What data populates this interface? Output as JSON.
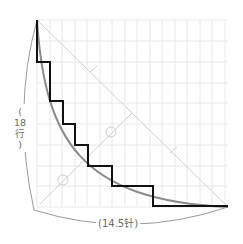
{
  "diagram": {
    "labels": {
      "height": "(18行)",
      "height_parts": [
        "(",
        "18",
        "行",
        ")"
      ],
      "width": "(14.5针)"
    },
    "colors": {
      "grid": "#e8e8e8",
      "steps": "#111111",
      "curve": "#8a8a8a",
      "guide": "#cfcfcf",
      "dimension": "#9a9a9a",
      "text": "#6a6a6a"
    },
    "geometry": {
      "origin_top": [
        37,
        20
      ],
      "bottom_right": [
        228,
        207
      ],
      "grid_step": 12.5
    },
    "step_points": [
      [
        37,
        20
      ],
      [
        37,
        62
      ],
      [
        50,
        62
      ],
      [
        50,
        101
      ],
      [
        63,
        101
      ],
      [
        63,
        124
      ],
      [
        75,
        124
      ],
      [
        75,
        145
      ],
      [
        88,
        145
      ],
      [
        88,
        166
      ],
      [
        112,
        166
      ],
      [
        112,
        186
      ],
      [
        153,
        186
      ],
      [
        153,
        206
      ],
      [
        228,
        206
      ]
    ],
    "markers": {
      "circles": [
        [
          111,
          132
        ],
        [
          63,
          180
        ]
      ],
      "ticks": [
        [
          94,
          69
        ],
        [
          173,
          150
        ]
      ]
    }
  }
}
